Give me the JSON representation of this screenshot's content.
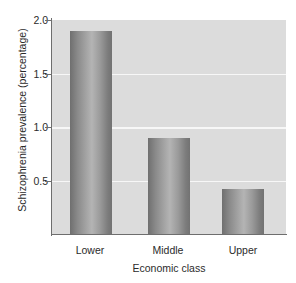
{
  "chart_data": {
    "type": "bar",
    "title": "",
    "subtitle": "",
    "xlabel": "Economic class",
    "ylabel": "Schizophrenia prevalence (percentage)",
    "categories": [
      "Lower",
      "Middle",
      "Upper"
    ],
    "values": [
      1.9,
      0.9,
      0.42
    ],
    "ylim": [
      0,
      2.0
    ],
    "yticks": [
      "0.5",
      "1.0",
      "1.5",
      "2.0"
    ],
    "ytick_values": [
      0.5,
      1.0,
      1.5,
      2.0
    ],
    "grid": "horizontal",
    "legend": "none",
    "annotations": [],
    "colors": {
      "plot_background": "#dcdcdc",
      "page_background": "#ffffff",
      "gridline": "#f7f7f7",
      "axis": "#6e6e6e",
      "text": "#2b2b2b",
      "bar_dark": "#6f6f6f",
      "bar_light": "#b4b4b4"
    }
  }
}
